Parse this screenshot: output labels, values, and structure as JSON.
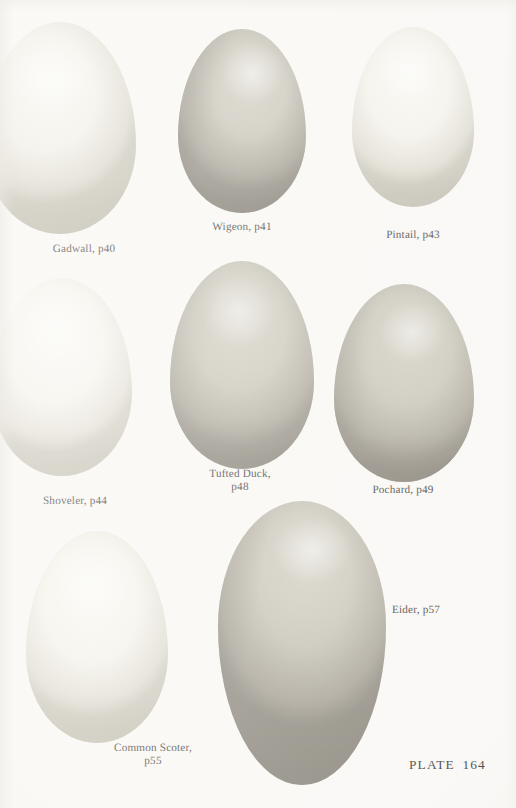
{
  "plate": {
    "number_label": "PLATE  164",
    "background_color": "#fbfaf8",
    "width": 516,
    "height": 808
  },
  "specimens": [
    {
      "id": "gadwall",
      "label": "Gadwall, p40",
      "page": "p40",
      "species": "Gadwall",
      "color": "#efece2",
      "shade_color": "#ddd8c9",
      "row": 1,
      "column": 1
    },
    {
      "id": "wigeon",
      "label": "Wigeon, p41",
      "page": "p41",
      "species": "Wigeon",
      "color": "#b4afa3",
      "shade_color": "#938d80",
      "row": 1,
      "column": 2
    },
    {
      "id": "pintail",
      "label": "Pintail, p43",
      "page": "p43",
      "species": "Pintail",
      "color": "#f2f0e8",
      "shade_color": "#e2ded2",
      "row": 1,
      "column": 3
    },
    {
      "id": "shoveler",
      "label": "Shoveler, p44",
      "page": "p44",
      "species": "Shoveler",
      "color": "#f5f3ec",
      "shade_color": "#e6e2d6",
      "row": 2,
      "column": 1
    },
    {
      "id": "tufted-duck",
      "label": "Tufted Duck,\np48",
      "page": "p48",
      "species": "Tufted Duck",
      "color": "#b9b5a8",
      "shade_color": "#9a9486",
      "row": 2,
      "column": 2
    },
    {
      "id": "pochard",
      "label": "Pochard, p49",
      "page": "p49",
      "species": "Pochard",
      "color": "#b7b3a6",
      "shade_color": "#979183",
      "row": 2,
      "column": 3
    },
    {
      "id": "common-scoter",
      "label": "Common Scoter,\np55",
      "page": "p55",
      "species": "Common Scoter",
      "color": "#f1eee4",
      "shade_color": "#e0dbcd",
      "row": 3,
      "column": 1
    },
    {
      "id": "eider",
      "label": "Eider, p57",
      "page": "p57",
      "species": "Eider",
      "color": "#b6b2a6",
      "shade_color": "#938d7f",
      "row": 3,
      "column": 2
    }
  ]
}
